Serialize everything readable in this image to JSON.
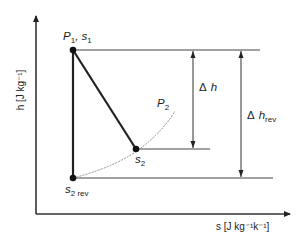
{
  "diagram": {
    "axes": {
      "y_label": "h [J kg⁻¹]",
      "x_label": "s [J kg⁻¹k⁻¹]"
    },
    "points": {
      "p1": {
        "label_main": "P",
        "label_sub": "1",
        "label_rest": ", s",
        "label_sub2": "1"
      },
      "s2": {
        "label_main": "s",
        "label_sub": "2"
      },
      "s2rev": {
        "label_main": "s",
        "label_sub": "2 rev"
      }
    },
    "curve": {
      "label_main": "P",
      "label_sub": "2"
    },
    "dimensions": {
      "delta_h": {
        "symbol": "Δ",
        "var": "h"
      },
      "delta_h_rev": {
        "symbol": "Δ",
        "var": "h",
        "sub": "rev"
      }
    },
    "colors": {
      "line": "#222222",
      "isobar": "#8a8a8a",
      "background": "#ffffff"
    }
  }
}
